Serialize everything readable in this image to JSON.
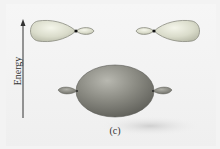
{
  "figure": {
    "axis_label": "Energy",
    "caption": "(c)",
    "orbitals": [
      {
        "name": "upper-left-sp-orbital",
        "orientation": "large lobe left"
      },
      {
        "name": "upper-right-sp-orbital",
        "orientation": "large lobe right"
      },
      {
        "name": "lower-bonding-orbital",
        "orientation": "combined"
      }
    ],
    "colors": {
      "upper_orbital_fill": "#d9dccb",
      "upper_orbital_stroke": "#8a8c80",
      "bonding_orbital_fill": "#8a8a82",
      "nucleus": "#111111",
      "arrow": "#333333"
    }
  }
}
